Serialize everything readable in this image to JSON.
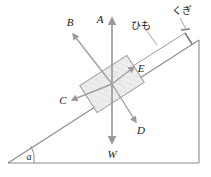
{
  "figure": {
    "background_color": "#ffffff",
    "line_color": "#8a8a8a",
    "dark_line_color": "#6e6e6e",
    "text_color": "#1a1a1a",
    "block_fill": "#e9e9ec",
    "block_stroke": "#9a9a9a"
  },
  "labels": {
    "vector_a": "A",
    "vector_b": "B",
    "vector_c": "C",
    "vector_d": "D",
    "vector_e": "E",
    "weight": "W",
    "angle": "a",
    "string": "ひも",
    "nail": "くぎ"
  },
  "vectors": [
    {
      "name": "A",
      "label": "A",
      "direction": "vertical-up",
      "from": [
        112,
        84
      ],
      "to": [
        112,
        17
      ]
    },
    {
      "name": "B",
      "label": "B",
      "direction": "up-left-normal",
      "from": [
        112,
        84
      ],
      "to": [
        72,
        33
      ]
    },
    {
      "name": "C",
      "label": "C",
      "direction": "down-left-along-incline",
      "from": [
        112,
        84
      ],
      "to": [
        70,
        101
      ]
    },
    {
      "name": "D",
      "label": "D",
      "direction": "down-right-normal",
      "from": [
        112,
        84
      ],
      "to": [
        137,
        123
      ]
    },
    {
      "name": "E",
      "label": "E",
      "direction": "up-right-along-incline",
      "from": [
        112,
        84
      ],
      "to": [
        135,
        67
      ]
    },
    {
      "name": "W",
      "label": "W",
      "direction": "vertical-down",
      "from": [
        112,
        84
      ],
      "to": [
        112,
        144
      ]
    }
  ],
  "incline": {
    "angle_label": "a",
    "base_from": [
      8,
      163
    ],
    "base_to": [
      199,
      163
    ],
    "slope_from": [
      8,
      163
    ],
    "slope_to": [
      199,
      40
    ],
    "vertical_from": [
      199,
      40
    ],
    "vertical_to": [
      199,
      163
    ]
  },
  "annotations": [
    {
      "name": "string-label",
      "text": "ひも",
      "x": 131,
      "y": 26
    },
    {
      "name": "nail-label",
      "text": "くぎ",
      "x": 173,
      "y": 13
    }
  ]
}
